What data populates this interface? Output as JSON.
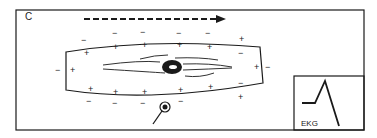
{
  "figure": {
    "panel_label": "C",
    "ekg_label": "EKG",
    "colors": {
      "line": "#1a1a1a",
      "background": "#ffffff"
    }
  },
  "diagram": {
    "outer_charges_top": [
      "−",
      "−",
      "−",
      "−",
      "−",
      "+"
    ],
    "inner_charges_top": [
      "+",
      "+",
      "+",
      "+",
      "+",
      "−"
    ],
    "inner_charges_bottom": [
      "+",
      "+",
      "+",
      "+",
      "+",
      "−"
    ],
    "outer_charges_bottom": [
      "−",
      "−",
      "−",
      "−",
      "−",
      "+"
    ],
    "left_end": {
      "outer": "−",
      "inner": "+"
    },
    "right_end": {
      "outer": "−",
      "inner": "+"
    },
    "arrow": "depolarization-direction-left-to-right",
    "electrode": "recording-electrode-bottom"
  }
}
